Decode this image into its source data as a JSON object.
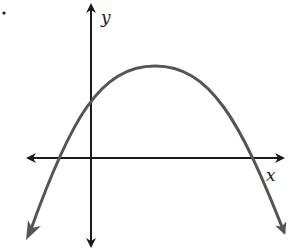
{
  "diagram": {
    "type": "parabola-graph",
    "axes": {
      "x_label": "x",
      "y_label": "y"
    },
    "curve": {
      "shape": "parabola",
      "opens": "down",
      "vertex_position": "first quadrant (x > 0, y > 0)",
      "y_intercept": "positive",
      "x_intercepts": [
        "negative",
        "positive"
      ],
      "ends": "arrows pointing downward"
    },
    "colors": {
      "axes": "#1a1a1a",
      "curve": "#555555",
      "background": "#ffffff"
    },
    "marker": "small dot at top-left"
  }
}
